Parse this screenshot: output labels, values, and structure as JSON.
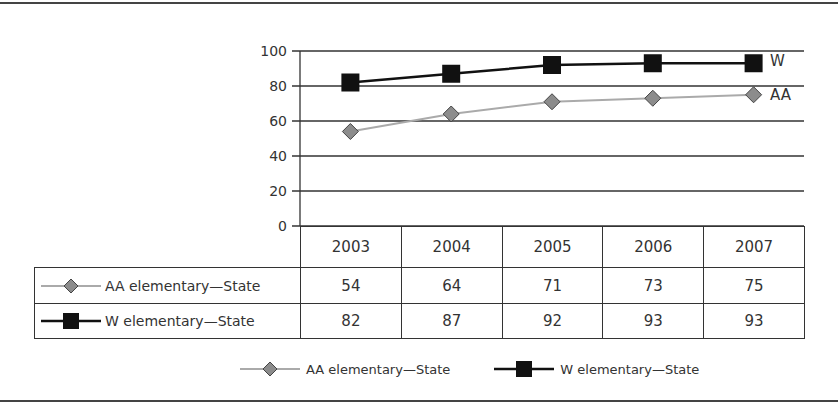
{
  "chart_data": {
    "type": "line",
    "title": "",
    "xlabel": "",
    "ylabel": "",
    "ylim": [
      0,
      100
    ],
    "yticks": [
      0,
      20,
      40,
      60,
      80,
      100
    ],
    "grid": true,
    "legend_position": "bottom",
    "categories": [
      "2003",
      "2004",
      "2005",
      "2006",
      "2007"
    ],
    "series": [
      {
        "name": "AA elementary—State",
        "short_label": "AA",
        "marker": "diamond",
        "color": "#aaaaaa",
        "marker_color": "#8c8c8c",
        "values": [
          54,
          64,
          71,
          73,
          75
        ]
      },
      {
        "name": "W elementary—State",
        "short_label": "W",
        "marker": "square",
        "color": "#111111",
        "marker_color": "#111111",
        "values": [
          82,
          87,
          92,
          93,
          93
        ]
      }
    ],
    "data_table": true
  },
  "axis": {
    "ticks": [
      "0",
      "20",
      "40",
      "60",
      "80",
      "100"
    ]
  },
  "table": {
    "header": [
      "2003",
      "2004",
      "2005",
      "2006",
      "2007"
    ],
    "rows": [
      {
        "label": "AA elementary—State",
        "values": [
          "54",
          "64",
          "71",
          "73",
          "75"
        ]
      },
      {
        "label": "W elementary—State",
        "values": [
          "82",
          "87",
          "92",
          "93",
          "93"
        ]
      }
    ]
  },
  "end_labels": {
    "w": "W",
    "aa": "AA"
  },
  "legend": {
    "items": [
      {
        "label": "AA elementary—State"
      },
      {
        "label": "W elementary—State"
      }
    ]
  }
}
